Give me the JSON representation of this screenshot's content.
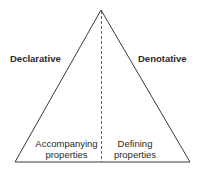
{
  "diagram": {
    "shape": "triangle",
    "left_label": "Declarative",
    "right_label": "Denotative",
    "left_region": {
      "line1": "Accompanying",
      "line2": "properties"
    },
    "right_region": {
      "line1": "Defining",
      "line2": "properties"
    },
    "colors": {
      "stroke": "#3a3a3a",
      "text": "#2a2a2a",
      "background": "#ffffff"
    }
  }
}
